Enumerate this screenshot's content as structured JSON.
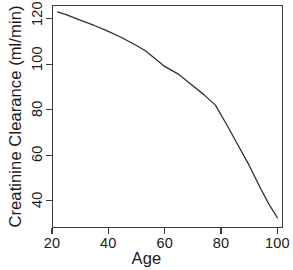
{
  "chart_data": {
    "type": "line",
    "title": "",
    "xlabel": "Age",
    "ylabel": "Creatinine Clearance (ml/min)",
    "xlim": [
      20,
      102
    ],
    "ylim": [
      28,
      126
    ],
    "xticks": [
      20,
      40,
      60,
      80,
      100
    ],
    "yticks": [
      40,
      60,
      80,
      100,
      120
    ],
    "xtick_labels": [
      "20",
      "40",
      "60",
      "80",
      "100"
    ],
    "ytick_labels": [
      "40",
      "60",
      "80",
      "100",
      "120"
    ],
    "grid": false,
    "legend": false,
    "line_color": "#303030",
    "line_width": 1.3,
    "background": "#ffffff",
    "frame": true,
    "series": [
      {
        "name": "Creatinine clearance",
        "x": [
          22,
          25,
          30,
          35,
          40,
          45,
          50,
          53,
          56,
          60,
          65,
          70,
          74,
          78,
          82,
          86,
          90,
          94,
          97,
          100
        ],
        "y": [
          123.0,
          121.8,
          119.4,
          117.0,
          114.4,
          111.5,
          108.2,
          106.0,
          103.0,
          99.0,
          95.5,
          90.5,
          86.5,
          82.0,
          73.5,
          64.5,
          55.5,
          45.5,
          38.5,
          32.5
        ]
      }
    ]
  }
}
